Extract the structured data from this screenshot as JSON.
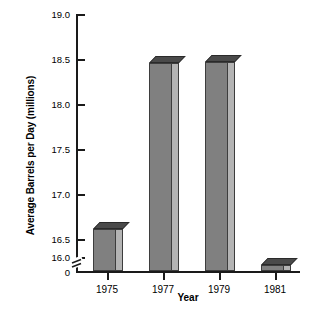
{
  "chart_data": {
    "type": "bar",
    "title": "",
    "xlabel": "Year",
    "ylabel": "Average Barrels per Day (millions)",
    "categories": [
      "1975",
      "1977",
      "1979",
      "1981"
    ],
    "values": [
      16.42,
      18.47,
      18.48,
      15.97
    ],
    "yticks": [
      "19.0",
      "18.5",
      "18.0",
      "17.5",
      "17.0",
      "16.5",
      "16.0",
      "0"
    ],
    "ytick_values": [
      19.0,
      18.5,
      18.0,
      17.5,
      17.0,
      16.5,
      16.0,
      0
    ],
    "ylim": [
      16.0,
      19.0
    ],
    "axis_break": true,
    "axis_break_note": "y-axis broken between 0 and 16.0",
    "grid": false,
    "legend": "none",
    "style": "3d-bars",
    "colors": {
      "bar_front": "#808080",
      "bar_side": "#b4b4b4",
      "bar_top": "#4a4a4a",
      "bar_outline": "#3d3d3d",
      "axis": "#1a1a1a",
      "background": "#ffffff",
      "text": "#000000"
    }
  }
}
